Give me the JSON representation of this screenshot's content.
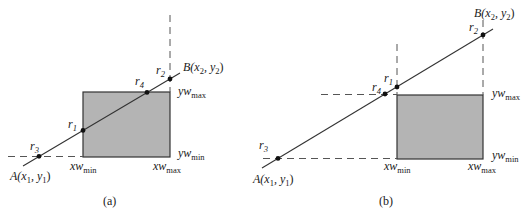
{
  "figure": {
    "colors": {
      "window_fill": "#b4b4b4",
      "window_stroke": "#333333",
      "line": "#333333",
      "dash": "#555555",
      "point": "#111111"
    }
  },
  "panels": [
    {
      "caption": "(a)",
      "endpoint_a": {
        "name": "A",
        "coords": "(x",
        "x_sub": "1",
        "mid": ", y",
        "y_sub": "1",
        "close": ")"
      },
      "endpoint_b": {
        "name": "B",
        "coords": "(x",
        "x_sub": "2",
        "mid": ", y",
        "y_sub": "2",
        "close": ")"
      },
      "points": [
        {
          "label": "r",
          "sub": "1"
        },
        {
          "label": "r",
          "sub": "2"
        },
        {
          "label": "r",
          "sub": "3"
        },
        {
          "label": "r",
          "sub": "4"
        }
      ],
      "axis_labels": {
        "xw_min": {
          "base": "xw",
          "sub": "min"
        },
        "xw_max": {
          "base": "xw",
          "sub": "max"
        },
        "yw_min": {
          "base": "yw",
          "sub": "min"
        },
        "yw_max": {
          "base": "yw",
          "sub": "max"
        }
      }
    },
    {
      "caption": "(b)",
      "endpoint_a": {
        "name": "A",
        "coords": "(x",
        "x_sub": "1",
        "mid": ", y",
        "y_sub": "1",
        "close": ")"
      },
      "endpoint_b": {
        "name": "B",
        "coords": "(x",
        "x_sub": "2",
        "mid": ", y",
        "y_sub": "2",
        "close": ")"
      },
      "points": [
        {
          "label": "r",
          "sub": "1"
        },
        {
          "label": "r",
          "sub": "2"
        },
        {
          "label": "r",
          "sub": "3"
        },
        {
          "label": "r",
          "sub": "4"
        }
      ],
      "axis_labels": {
        "xw_min": {
          "base": "xw",
          "sub": "min"
        },
        "xw_max": {
          "base": "xw",
          "sub": "max"
        },
        "yw_min": {
          "base": "yw",
          "sub": "min"
        },
        "yw_max": {
          "base": "yw",
          "sub": "max"
        }
      }
    }
  ]
}
